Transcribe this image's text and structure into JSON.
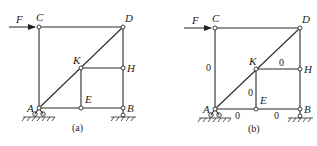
{
  "figure": {
    "panels": [
      {
        "id": "a",
        "caption": "(a)",
        "force_label": "F",
        "nodes": {
          "A": "A",
          "B": "B",
          "C": "C",
          "D": "D",
          "E": "E",
          "H": "H",
          "K": "K"
        },
        "zero_labels": []
      },
      {
        "id": "b",
        "caption": "(b)",
        "force_label": "F",
        "nodes": {
          "A": "A",
          "B": "B",
          "C": "C",
          "D": "D",
          "E": "E",
          "H": "H",
          "K": "K"
        },
        "zero_labels": [
          "0",
          "0",
          "0",
          "0",
          "0"
        ]
      }
    ],
    "members": [
      "AC",
      "CD",
      "DB",
      "AD",
      "KH",
      "KE",
      "AE",
      "EB",
      "DH",
      "HB"
    ],
    "zero_force_members_b": [
      "AC",
      "KH",
      "KE",
      "AE",
      "EB"
    ],
    "supports": {
      "A": "pin",
      "B": "roller"
    }
  }
}
